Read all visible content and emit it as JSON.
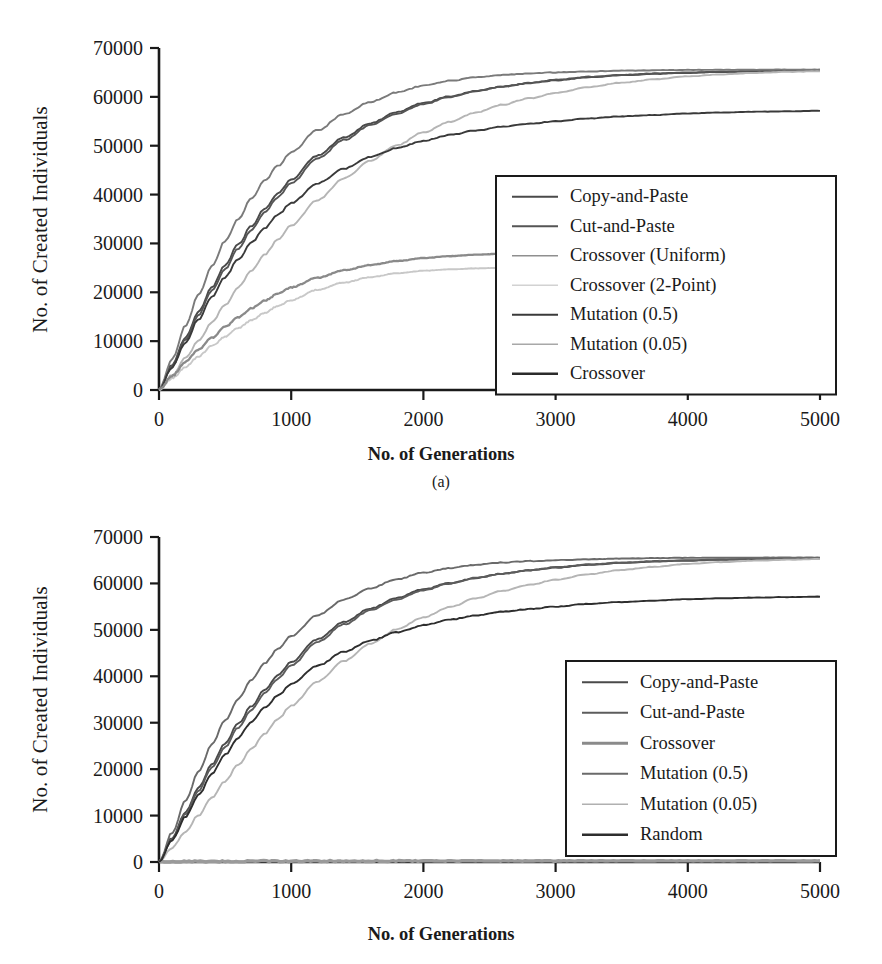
{
  "figure": {
    "panels": [
      {
        "id": "a",
        "caption": "(a)",
        "xlabel": "No. of Generations",
        "ylabel": "No. of Created Individuals"
      },
      {
        "id": "b",
        "caption": "",
        "xlabel": "No. of Generations",
        "ylabel": "No. of Created Individuals"
      }
    ]
  },
  "chart_data": [
    {
      "panel": "a",
      "type": "line",
      "title": "",
      "xlabel": "No. of Generations",
      "ylabel": "No. of Created Individuals",
      "xlim": [
        0,
        5000
      ],
      "ylim": [
        0,
        70000
      ],
      "xticks": [
        0,
        1000,
        2000,
        3000,
        4000,
        5000
      ],
      "yticks": [
        0,
        10000,
        20000,
        30000,
        40000,
        50000,
        60000,
        70000
      ],
      "xtick_labels": [
        "0",
        "1000",
        "2000",
        "3000",
        "4000",
        "5000"
      ],
      "ytick_labels": [
        "0",
        "10000",
        "20000",
        "30000",
        "40000",
        "50000",
        "60000",
        "70000"
      ],
      "grid": false,
      "legend_position": "center-right",
      "x": [
        0,
        100,
        200,
        300,
        400,
        500,
        600,
        700,
        800,
        900,
        1000,
        1200,
        1400,
        1600,
        1800,
        2000,
        2200,
        2400,
        2600,
        2800,
        3000,
        3250,
        3500,
        3750,
        4000,
        4250,
        4500,
        4750,
        5000
      ],
      "series": [
        {
          "name": "Copy-and-Paste",
          "color": "#4a4a4a",
          "values": [
            0,
            5200,
            10700,
            16000,
            21000,
            25600,
            29800,
            33600,
            37100,
            40200,
            43100,
            48000,
            51700,
            54600,
            56900,
            58700,
            60100,
            61200,
            62100,
            62800,
            63400,
            64000,
            64400,
            64700,
            64900,
            65100,
            65250,
            65350,
            65450
          ]
        },
        {
          "name": "Cut-and-Paste",
          "color": "#555555",
          "values": [
            0,
            5000,
            10300,
            15400,
            20300,
            24800,
            29000,
            32800,
            36300,
            39500,
            42400,
            47400,
            51200,
            54200,
            56600,
            58500,
            60000,
            61200,
            62100,
            62900,
            63500,
            64100,
            64500,
            64800,
            65000,
            65150,
            65300,
            65400,
            65480
          ]
        },
        {
          "name": "Crossover (Uniform)",
          "color": "#7a7a7a",
          "values": [
            0,
            6400,
            13100,
            19500,
            25300,
            30500,
            35100,
            39200,
            42800,
            45900,
            48700,
            53200,
            56500,
            59000,
            60900,
            62300,
            63300,
            64000,
            64500,
            64800,
            65000,
            65200,
            65350,
            65450,
            65520,
            65540,
            65550,
            65560,
            65570
          ]
        },
        {
          "name": "Crossover (2-Point)",
          "color": "#b5b5b5",
          "values": [
            0,
            3100,
            6500,
            10100,
            13800,
            17400,
            21000,
            24400,
            27700,
            30800,
            33700,
            38900,
            43300,
            47000,
            50100,
            52700,
            54900,
            56800,
            58400,
            59700,
            60800,
            62000,
            62900,
            63600,
            64200,
            64600,
            64900,
            65100,
            65250
          ]
        },
        {
          "name": "Mutation (0.5)",
          "color": "#3a3a3a",
          "values": [
            0,
            4700,
            9700,
            14500,
            19000,
            23100,
            26800,
            30200,
            33200,
            35900,
            38300,
            42300,
            45300,
            47700,
            49500,
            51000,
            52200,
            53100,
            53900,
            54500,
            55000,
            55600,
            56000,
            56300,
            56600,
            56800,
            56950,
            57050,
            57150
          ]
        },
        {
          "name": "Mutation (0.05)",
          "color": "#c8c8c8",
          "values": [
            0,
            2400,
            4700,
            6900,
            9000,
            10900,
            12700,
            14300,
            15800,
            17200,
            18400,
            20500,
            22000,
            23100,
            23900,
            24400,
            24700,
            24900,
            25000,
            null,
            null,
            null,
            null,
            null,
            null,
            null,
            null,
            null,
            null
          ]
        },
        {
          "name": "Crossover",
          "color": "#8a8a8a",
          "values": [
            0,
            2900,
            5700,
            8300,
            10700,
            12900,
            14900,
            16700,
            18300,
            19700,
            21000,
            23000,
            24500,
            25600,
            26400,
            27000,
            27400,
            27700,
            27900,
            null,
            null,
            null,
            null,
            null,
            null,
            null,
            null,
            null,
            null
          ]
        }
      ],
      "legend": [
        {
          "label": "Copy-and-Paste",
          "color": "#4a4a4a",
          "width": 2.0
        },
        {
          "label": "Cut-and-Paste",
          "color": "#555555",
          "width": 1.8
        },
        {
          "label": "Crossover (Uniform)",
          "color": "#8f8f8f",
          "width": 1.6
        },
        {
          "label": "Crossover (2-Point)",
          "color": "#d2d2d2",
          "width": 1.6
        },
        {
          "label": "Mutation (0.5)",
          "color": "#3a3a3a",
          "width": 2.2
        },
        {
          "label": "Mutation (0.05)",
          "color": "#a8a8a8",
          "width": 1.6
        },
        {
          "label": "Crossover",
          "color": "#2b2b2b",
          "width": 2.4
        }
      ]
    },
    {
      "panel": "b",
      "type": "line",
      "title": "",
      "xlabel": "No. of Generations",
      "ylabel": "No. of Created Individuals",
      "xlim": [
        0,
        5000
      ],
      "ylim": [
        0,
        70000
      ],
      "xticks": [
        0,
        1000,
        2000,
        3000,
        4000,
        5000
      ],
      "yticks": [
        0,
        10000,
        20000,
        30000,
        40000,
        50000,
        60000,
        70000
      ],
      "xtick_labels": [
        "0",
        "1000",
        "2000",
        "3000",
        "4000",
        "5000"
      ],
      "ytick_labels": [
        "0",
        "10000",
        "20000",
        "30000",
        "40000",
        "50000",
        "60000",
        "70000"
      ],
      "grid": false,
      "legend_position": "center-right",
      "x": [
        0,
        100,
        200,
        300,
        400,
        500,
        600,
        700,
        800,
        900,
        1000,
        1200,
        1400,
        1600,
        1800,
        2000,
        2200,
        2400,
        2600,
        2800,
        3000,
        3250,
        3500,
        3750,
        4000,
        4250,
        4500,
        4750,
        5000
      ],
      "series": [
        {
          "name": "Copy-and-Paste",
          "color": "#4a4a4a",
          "values": [
            0,
            5200,
            10700,
            16000,
            21000,
            25600,
            29800,
            33600,
            37100,
            40200,
            43100,
            48000,
            51700,
            54600,
            56900,
            58700,
            60100,
            61200,
            62100,
            62800,
            63400,
            64000,
            64400,
            64700,
            64900,
            65100,
            65250,
            65350,
            65450
          ]
        },
        {
          "name": "Cut-and-Paste",
          "color": "#5c5c5c",
          "values": [
            0,
            5000,
            10300,
            15400,
            20300,
            24800,
            29000,
            32800,
            36300,
            39500,
            42400,
            47400,
            51200,
            54200,
            56600,
            58500,
            60000,
            61200,
            62100,
            62900,
            63500,
            64100,
            64500,
            64800,
            65000,
            65150,
            65300,
            65400,
            65480
          ]
        },
        {
          "name": "Crossover",
          "color": "#9a9a9a",
          "values": [
            0,
            60,
            90,
            110,
            130,
            145,
            155,
            165,
            175,
            182,
            190,
            200,
            210,
            215,
            220,
            225,
            228,
            230,
            232,
            234,
            236,
            238,
            240,
            241,
            242,
            243,
            244,
            245,
            246
          ]
        },
        {
          "name": "Mutation (0.5)",
          "color": "#6a6a6a",
          "values": [
            0,
            6400,
            13100,
            19500,
            25300,
            30500,
            35100,
            39200,
            42800,
            45900,
            48700,
            53200,
            56500,
            59000,
            60900,
            62300,
            63300,
            64000,
            64500,
            64800,
            65000,
            65200,
            65350,
            65450,
            65520,
            65540,
            65550,
            65560,
            65570
          ]
        },
        {
          "name": "Mutation (0.05)",
          "color": "#b5b5b5",
          "values": [
            0,
            3100,
            6500,
            10100,
            13800,
            17400,
            21000,
            24400,
            27700,
            30800,
            33700,
            38900,
            43300,
            47000,
            50100,
            52700,
            54900,
            56800,
            58400,
            59700,
            60800,
            62000,
            62900,
            63600,
            64200,
            64600,
            64900,
            65100,
            65250
          ]
        },
        {
          "name": "Random",
          "color": "#2e2e2e",
          "values": [
            0,
            4700,
            9700,
            14500,
            19000,
            23100,
            26800,
            30200,
            33200,
            35900,
            38300,
            42300,
            45300,
            47700,
            49500,
            51000,
            52200,
            53100,
            53900,
            54500,
            55000,
            55600,
            56000,
            56300,
            56600,
            56800,
            56950,
            57050,
            57150
          ]
        }
      ],
      "legend": [
        {
          "label": "Copy-and-Paste",
          "color": "#4a4a4a",
          "width": 2.0
        },
        {
          "label": "Cut-and-Paste",
          "color": "#5c5c5c",
          "width": 1.8
        },
        {
          "label": "Crossover",
          "color": "#8a8a8a",
          "width": 3.2
        },
        {
          "label": "Mutation (0.5)",
          "color": "#6a6a6a",
          "width": 2.0
        },
        {
          "label": "Mutation (0.05)",
          "color": "#b0b0b0",
          "width": 1.6
        },
        {
          "label": "Random",
          "color": "#2e2e2e",
          "width": 2.4
        }
      ]
    }
  ]
}
